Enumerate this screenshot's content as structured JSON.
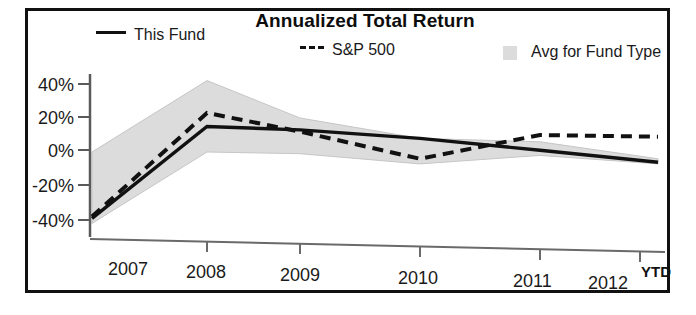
{
  "chart_data": {
    "type": "line",
    "title": "Annualized Total Return",
    "xlabel": "",
    "ylabel": "",
    "categories": [
      "2007",
      "2008",
      "2009",
      "2010",
      "2011",
      "2012 YTD"
    ],
    "x_tick_labels": [
      "2007",
      "2008",
      "2009",
      "2010",
      "2011",
      "2012"
    ],
    "x_suffix_label": "YTD",
    "y_tick_labels": [
      "40%",
      "20%",
      "0%",
      "-20%",
      "-40%"
    ],
    "y_tick_values": [
      40,
      20,
      0,
      -20,
      -40
    ],
    "ylim": [
      -45,
      45
    ],
    "grid": false,
    "legend_position": "top",
    "series": [
      {
        "name": "This Fund",
        "style": "solid",
        "color": "#111111",
        "values": [
          -39,
          15,
          13,
          8,
          1,
          -6
        ]
      },
      {
        "name": "S&P 500",
        "style": "dashed",
        "color": "#111111",
        "values": [
          -38,
          23,
          12,
          -4,
          10,
          9
        ]
      },
      {
        "name": "Avg for Fund Type",
        "style": "band",
        "color": "#dcdcdc",
        "upper_values": [
          0,
          42,
          20,
          8,
          6,
          -4
        ],
        "lower_values": [
          -42,
          0,
          -1,
          -7,
          -2,
          -7
        ]
      }
    ]
  },
  "chart": {
    "title": "Annualized Total Return",
    "legend": {
      "this_fund": "This Fund",
      "sp500": "S&P 500",
      "avg_fund_type": "Avg for Fund Type"
    },
    "axis": {
      "y_labels": [
        "40%",
        "20%",
        "0%",
        "-20%",
        "-40%"
      ],
      "x_labels": [
        "2007",
        "2008",
        "2009",
        "2010",
        "2011",
        "2012"
      ],
      "ytd": "YTD"
    },
    "colors": {
      "line": "#111111",
      "band": "#dcdcdc",
      "frame": "#111111",
      "axis": "#555555"
    }
  }
}
